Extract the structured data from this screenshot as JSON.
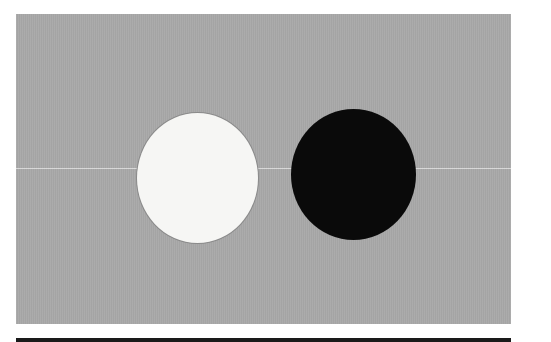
{
  "figure": {
    "background_color": "#a9a9a9",
    "shapes": [
      {
        "name": "white-circle",
        "color": "#f6f6f4"
      },
      {
        "name": "black-circle",
        "color": "#0a0a0a"
      }
    ],
    "bottom_rule_color": "#1a1a1a"
  }
}
